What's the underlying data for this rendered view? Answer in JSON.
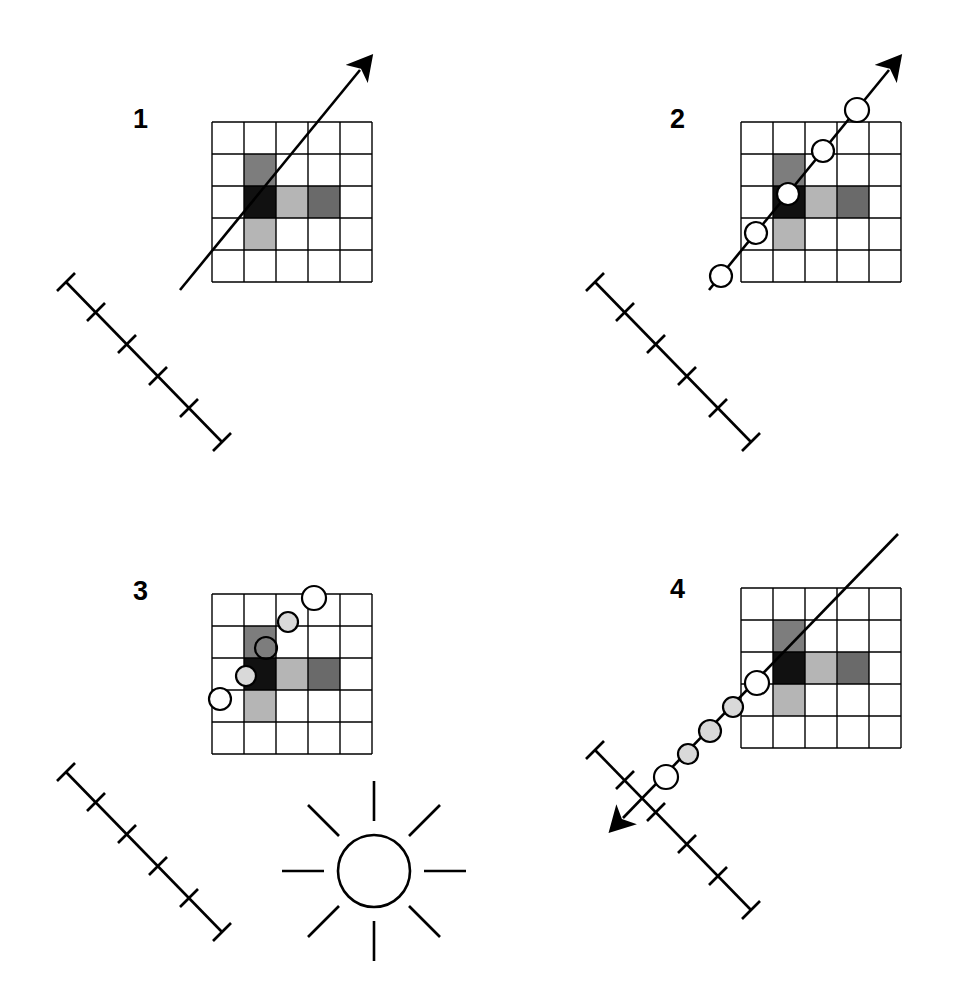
{
  "figure": {
    "type": "scientific-diagram",
    "background_color": "#ffffff",
    "width": 965,
    "height": 999,
    "line_color": "#000000",
    "panel_count": 4,
    "layout": "2x2"
  },
  "palette": {
    "black": "#111111",
    "medium_gray": "#7d7d7d",
    "light_gray": "#b5b5b5",
    "dark_gray": "#6a6a6a",
    "white": "#ffffff",
    "stroke": "#000000",
    "circle_fill_white": "#ffffff",
    "circle_fill_tint": "#d9d9d9"
  },
  "grid": {
    "rows": 5,
    "cols": 5,
    "cell_size": 32,
    "stroke_width": 1.4,
    "cells": [
      {
        "row": 1,
        "col": 1,
        "shade": "medium_gray"
      },
      {
        "row": 2,
        "col": 1,
        "shade": "black"
      },
      {
        "row": 2,
        "col": 2,
        "shade": "light_gray"
      },
      {
        "row": 2,
        "col": 3,
        "shade": "dark_gray"
      },
      {
        "row": 3,
        "col": 1,
        "shade": "light_gray"
      }
    ]
  },
  "scalebar": {
    "tick_count": 4,
    "end_caps": 2,
    "angle_deg": 45,
    "description": "diagonal scale bar with end caps and four intermediate tick marks"
  },
  "panels": [
    {
      "id": "panel-1",
      "label": "1",
      "arrow": {
        "present": true,
        "direction": "up-right",
        "head": "filled-triangle",
        "head_at": "end"
      },
      "circles": [],
      "scalebar": true,
      "sun_symbol": false
    },
    {
      "id": "panel-2",
      "label": "2",
      "arrow": {
        "present": true,
        "direction": "up-right",
        "head": "filled-triangle",
        "head_at": "end"
      },
      "circles": [
        {
          "index": 1,
          "fill": "white"
        },
        {
          "index": 2,
          "fill": "white"
        },
        {
          "index": 3,
          "fill": "white"
        },
        {
          "index": 4,
          "fill": "white"
        },
        {
          "index": 5,
          "fill": "white"
        }
      ],
      "scalebar": true,
      "sun_symbol": false
    },
    {
      "id": "panel-3",
      "label": "3",
      "arrow": {
        "present": false,
        "direction": "none",
        "head": "none",
        "head_at": "none"
      },
      "circles": [
        {
          "index": 1,
          "fill": "white"
        },
        {
          "index": 2,
          "fill": "tint"
        },
        {
          "index": 3,
          "fill": "transparent"
        },
        {
          "index": 4,
          "fill": "tint"
        },
        {
          "index": 5,
          "fill": "white"
        }
      ],
      "scalebar": true,
      "sun_symbol": true
    },
    {
      "id": "panel-4",
      "label": "4",
      "arrow": {
        "present": true,
        "direction": "down-left",
        "head": "filled-triangle",
        "head_at": "start"
      },
      "circles": [
        {
          "index": 1,
          "fill": "white"
        },
        {
          "index": 2,
          "fill": "tint"
        },
        {
          "index": 3,
          "fill": "tint"
        },
        {
          "index": 4,
          "fill": "tint"
        },
        {
          "index": 5,
          "fill": "white"
        }
      ],
      "scalebar": true,
      "sun_symbol": false
    }
  ],
  "sun_symbol": {
    "ray_count": 8,
    "circle_fill": "#ffffff",
    "stroke": "#000000",
    "description": "open circle with eight radiating straight rays"
  }
}
